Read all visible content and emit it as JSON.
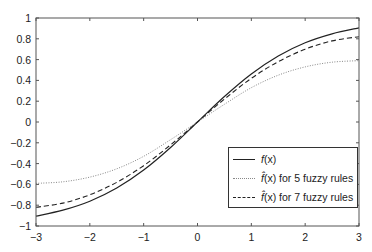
{
  "chart_data": {
    "type": "line",
    "title": "",
    "xlabel": "",
    "ylabel": "",
    "xlim": [
      -3,
      3
    ],
    "ylim": [
      -1,
      1
    ],
    "xticks": [
      -3,
      -2,
      -1,
      0,
      1,
      2,
      3
    ],
    "yticks": [
      -1,
      -0.8,
      -0.6,
      -0.4,
      -0.2,
      0,
      0.2,
      0.4,
      0.6,
      0.8,
      1
    ],
    "xtick_labels": [
      "−3",
      "−2",
      "−1",
      "0",
      "1",
      "2",
      "3"
    ],
    "ytick_labels": [
      "−1",
      "−0.8",
      "−0.6",
      "−0.4",
      "−0.2",
      "0",
      "0.2",
      "0.4",
      "0.6",
      "0.8",
      "1"
    ],
    "grid": false,
    "legend_position": "lower right (inside)",
    "x": [
      -3,
      -2.5,
      -2,
      -1.5,
      -1,
      -0.5,
      0,
      0.5,
      1,
      1.5,
      2,
      2.5,
      3
    ],
    "series": [
      {
        "name": "f(x)",
        "style": "solid",
        "values": [
          -0.905,
          -0.848,
          -0.762,
          -0.635,
          -0.462,
          -0.245,
          0,
          0.245,
          0.462,
          0.635,
          0.762,
          0.848,
          0.905
        ]
      },
      {
        "name": "f̂(x) for 5 fuzzy rules",
        "style": "dotted",
        "values": [
          -0.59,
          -0.575,
          -0.53,
          -0.45,
          -0.33,
          -0.17,
          0,
          0.17,
          0.33,
          0.45,
          0.53,
          0.575,
          0.59
        ]
      },
      {
        "name": "f̂(x) for 7 fuzzy rules",
        "style": "dashed",
        "values": [
          -0.82,
          -0.78,
          -0.7,
          -0.58,
          -0.42,
          -0.22,
          0,
          0.22,
          0.42,
          0.58,
          0.7,
          0.78,
          0.82
        ]
      }
    ]
  },
  "legend": {
    "items": [
      {
        "label_prefix": "f",
        "label_rest": "(x)",
        "style": "solid"
      },
      {
        "label_prefix": "f̂",
        "label_rest": "(x) for 5 fuzzy rules",
        "style": "dotted"
      },
      {
        "label_prefix": "f̂",
        "label_rest": "(x) for 7 fuzzy rules",
        "style": "dashed"
      }
    ]
  },
  "colors": {
    "axis": "#555555",
    "line": "#222222",
    "dotted": "#888888"
  }
}
